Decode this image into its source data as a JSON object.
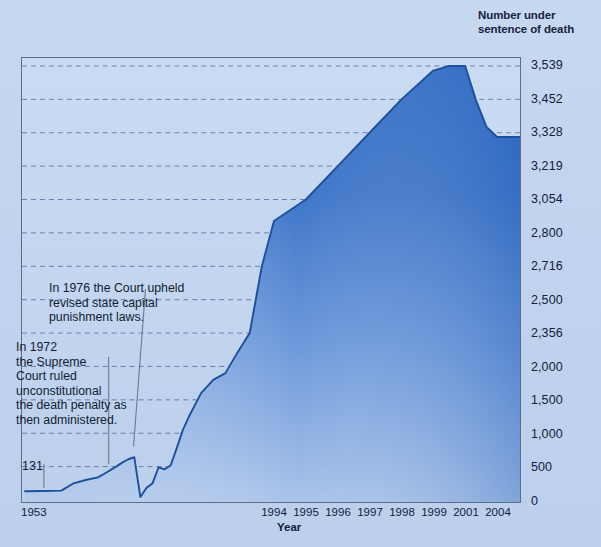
{
  "page": {
    "top_fragment_left": "",
    "top_fragment_mid": ""
  },
  "header": {
    "axis_heading_line1": "Number under",
    "axis_heading_line2": "sentence of death"
  },
  "annotations": {
    "note_1976": "In 1976 the Court upheld revised state capital punishment laws.",
    "note_1972": "In 1972\nthe Supreme\nCourt ruled\nunconstitutional\nthe death penalty as\nthen administered.",
    "start_value_label": "131"
  },
  "colors": {
    "page_background": "#c3d5ef",
    "plot_background": "#c5d7f0",
    "area_fill_top": "#2f6bc4",
    "area_fill_bottom": "#a8c2e8",
    "line": "#1c4f9c",
    "frame": "#5a6e8c",
    "grid": "#4a6fa5",
    "text": "#13203a",
    "leader_line": "#5a6a80"
  },
  "chart_data": {
    "type": "area",
    "title": "",
    "xlabel": "Year",
    "ylabel": "Number under sentence of death",
    "grid": true,
    "legend": false,
    "y_tick_labels": [
      "3,539",
      "3,452",
      "3,328",
      "3,219",
      "3,054",
      "2,800",
      "2,716",
      "2,500",
      "2,356",
      "2,000",
      "1,500",
      "1,000",
      "500",
      "0"
    ],
    "y_tick_values": [
      3539,
      3452,
      3328,
      3219,
      3054,
      2800,
      2716,
      2500,
      2356,
      2000,
      1500,
      1000,
      500,
      0
    ],
    "ylim": [
      0,
      3539
    ],
    "x_tick_labels": [
      "1953",
      "1994",
      "1995",
      "1996",
      "1997",
      "1998",
      "1999",
      "2001",
      "2004"
    ],
    "x_tick_years": [
      1953,
      1994,
      1995,
      1996,
      1997,
      1998,
      1999,
      2001,
      2004
    ],
    "x": [
      1953,
      1956,
      1959,
      1961,
      1963,
      1965,
      1966,
      1968,
      1969,
      1970,
      1971,
      1972,
      1973,
      1974,
      1975,
      1976,
      1977,
      1978,
      1979,
      1980,
      1982,
      1984,
      1986,
      1988,
      1990,
      1992,
      1994,
      1995,
      1996,
      1997,
      1998,
      1999,
      2000,
      2001,
      2002,
      2003,
      2004
    ],
    "values": [
      131,
      135,
      140,
      250,
      300,
      340,
      390,
      500,
      560,
      610,
      640,
      45,
      180,
      250,
      490,
      460,
      520,
      780,
      1050,
      1250,
      1600,
      1800,
      1900,
      2150,
      2356,
      2716,
      2890,
      3054,
      3219,
      3328,
      3452,
      3527,
      3539,
      3539,
      3450,
      3350,
      3314
    ],
    "annotations": [
      {
        "year": 1972,
        "text": "In 1972 the Supreme Court ruled unconstitutional the death penalty as then administered."
      },
      {
        "year": 1976,
        "text": "In 1976 the Court upheld revised state capital punishment laws."
      },
      {
        "year": 1953,
        "text": "131",
        "value": 131
      }
    ]
  }
}
